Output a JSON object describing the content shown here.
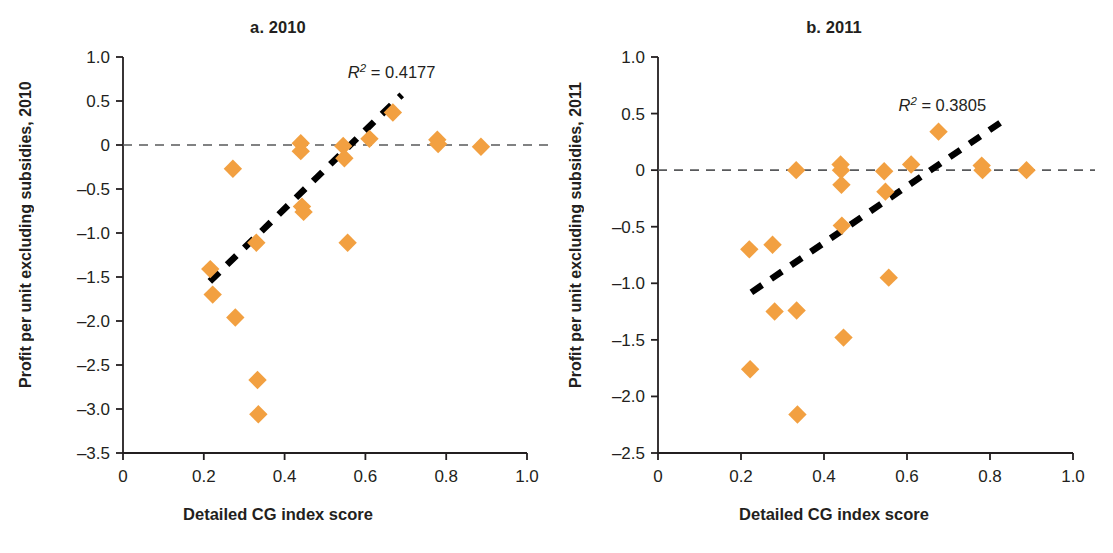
{
  "figure": {
    "background": "#ffffff",
    "marker_color": "#F2A041",
    "axis_color": "#231f20",
    "trend_color": "#000000",
    "zero_line_color": "#58595b"
  },
  "panels": [
    {
      "id": "a",
      "title": "a. 2010",
      "ylabel": "Profit per unit excluding subsidies, 2010",
      "xlabel": "Detailed CG index score",
      "annotation": {
        "r": "R",
        "sup": "2",
        "eq": " = 0.4177"
      }
    },
    {
      "id": "b",
      "title": "b. 2011",
      "ylabel": "Profit per unit excluding subsidies, 2011",
      "xlabel": "Detailed CG index score",
      "annotation": {
        "r": "R",
        "sup": "2",
        "eq": " = 0.3805"
      }
    }
  ],
  "chart_data": [
    {
      "type": "scatter",
      "title": "a. 2010",
      "xlabel": "Detailed CG index score",
      "ylabel": "Profit per unit excluding subsidies, 2010",
      "xlim": [
        0,
        1.0
      ],
      "ylim": [
        -3.5,
        1.0
      ],
      "xticks": [
        0,
        0.2,
        0.4,
        0.6,
        0.8,
        1.0
      ],
      "xticklabels": [
        "0",
        "0.2",
        "0.4",
        "0.6",
        "0.8",
        "1.0"
      ],
      "yticks": [
        1.0,
        0.5,
        0,
        -0.5,
        -1.0,
        -1.5,
        -2.0,
        -2.5,
        -3.0,
        -3.5
      ],
      "yticklabels": [
        "1.0",
        "0.5",
        "0",
        "-0.5",
        "-1.0",
        "-1.5",
        "-2.0",
        "-2.5",
        "-3.0",
        "-3.5"
      ],
      "grid": false,
      "legend": "none",
      "annotations": [
        {
          "text": "R² = 0.4177",
          "x": 0.665,
          "y": 0.76
        }
      ],
      "reference_line": {
        "y": 0,
        "style": "dashed",
        "color": "#58595b"
      },
      "trendline": {
        "style": "dashed",
        "color": "#000000",
        "x": [
          0.215,
          0.69
        ],
        "y": [
          -1.55,
          0.57
        ],
        "r_squared": 0.4177
      },
      "points": [
        {
          "x": 0.216,
          "y": -1.41
        },
        {
          "x": 0.222,
          "y": -1.7
        },
        {
          "x": 0.272,
          "y": -0.27
        },
        {
          "x": 0.278,
          "y": -1.96
        },
        {
          "x": 0.33,
          "y": -1.11
        },
        {
          "x": 0.333,
          "y": -2.67
        },
        {
          "x": 0.335,
          "y": -3.06
        },
        {
          "x": 0.44,
          "y": 0.02
        },
        {
          "x": 0.44,
          "y": -0.07
        },
        {
          "x": 0.443,
          "y": -0.7
        },
        {
          "x": 0.447,
          "y": -0.76
        },
        {
          "x": 0.545,
          "y": -0.01
        },
        {
          "x": 0.548,
          "y": -0.15
        },
        {
          "x": 0.556,
          "y": -1.11
        },
        {
          "x": 0.61,
          "y": 0.07
        },
        {
          "x": 0.668,
          "y": 0.37
        },
        {
          "x": 0.778,
          "y": 0.06
        },
        {
          "x": 0.78,
          "y": 0.01
        },
        {
          "x": 0.886,
          "y": -0.02
        }
      ]
    },
    {
      "type": "scatter",
      "title": "b. 2011",
      "xlabel": "Detailed CG index score",
      "ylabel": "Profit per unit excluding subsidies, 2011",
      "xlim": [
        0,
        1.0
      ],
      "ylim": [
        -2.5,
        1.0
      ],
      "xticks": [
        0,
        0.2,
        0.4,
        0.6,
        0.8,
        1.0
      ],
      "xticklabels": [
        "0",
        "0.2",
        "0.4",
        "0.6",
        "0.8",
        "1.0"
      ],
      "yticks": [
        1.0,
        0.5,
        0,
        -0.5,
        -1.0,
        -1.5,
        -2.0,
        -2.5
      ],
      "yticklabels": [
        "1.0",
        "0.5",
        "0",
        "-0.5",
        "-1.0",
        "-1.5",
        "-2.0",
        "-2.5"
      ],
      "grid": false,
      "legend": "none",
      "annotations": [
        {
          "text": "R² = 0.3805",
          "x": 0.685,
          "y": 0.52
        }
      ],
      "reference_line": {
        "y": 0,
        "style": "dashed",
        "color": "#58595b"
      },
      "trendline": {
        "style": "dashed",
        "color": "#000000",
        "x": [
          0.225,
          0.825
        ],
        "y": [
          -1.08,
          0.42
        ],
        "r_squared": 0.3805
      },
      "points": [
        {
          "x": 0.22,
          "y": -0.7
        },
        {
          "x": 0.222,
          "y": -1.76
        },
        {
          "x": 0.276,
          "y": -0.66
        },
        {
          "x": 0.281,
          "y": -1.25
        },
        {
          "x": 0.333,
          "y": 0.0
        },
        {
          "x": 0.334,
          "y": -1.24
        },
        {
          "x": 0.336,
          "y": -2.16
        },
        {
          "x": 0.44,
          "y": 0.05
        },
        {
          "x": 0.441,
          "y": 0.0
        },
        {
          "x": 0.442,
          "y": -0.13
        },
        {
          "x": 0.443,
          "y": -0.49
        },
        {
          "x": 0.447,
          "y": -1.48
        },
        {
          "x": 0.545,
          "y": -0.01
        },
        {
          "x": 0.548,
          "y": -0.19
        },
        {
          "x": 0.556,
          "y": -0.95
        },
        {
          "x": 0.61,
          "y": 0.05
        },
        {
          "x": 0.676,
          "y": 0.34
        },
        {
          "x": 0.78,
          "y": 0.04
        },
        {
          "x": 0.782,
          "y": 0.0
        },
        {
          "x": 0.888,
          "y": 0.0
        }
      ]
    }
  ]
}
